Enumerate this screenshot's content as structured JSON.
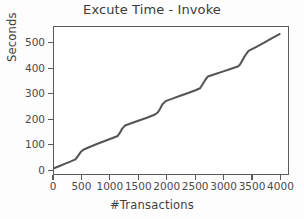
{
  "chart_data": {
    "type": "line",
    "title": "Excute Time - Invoke",
    "xlabel": "#Transactions",
    "ylabel": "Seconds",
    "xlim": [
      0,
      4150
    ],
    "ylim": [
      -18,
      565
    ],
    "grid": false,
    "legend": null,
    "line_color": "#555555",
    "line_width": 2.1,
    "xticks": [
      0,
      500,
      1000,
      1500,
      2000,
      2500,
      3000,
      3500,
      4000
    ],
    "xtick_labels": [
      "0",
      "500",
      "1000",
      "1500",
      "2000",
      "2500",
      "3000",
      "3500",
      "4000"
    ],
    "yticks": [
      0,
      100,
      200,
      300,
      400,
      500
    ],
    "ytick_labels": [
      "0",
      "100",
      "200",
      "300",
      "400",
      "500"
    ],
    "series": [
      {
        "name": "Invoke",
        "x": [
          0,
          100,
          200,
          300,
          380,
          420,
          470,
          520,
          620,
          760,
          900,
          1040,
          1130,
          1170,
          1210,
          1260,
          1380,
          1520,
          1660,
          1790,
          1840,
          1880,
          1920,
          1980,
          2100,
          2240,
          2380,
          2520,
          2590,
          2630,
          2680,
          2730,
          2850,
          2990,
          3130,
          3260,
          3300,
          3340,
          3390,
          3450,
          3580,
          3720,
          3860,
          4000
        ],
        "y": [
          5,
          14,
          23,
          32,
          40,
          52,
          68,
          78,
          88,
          101,
          113,
          125,
          133,
          146,
          162,
          174,
          184,
          195,
          206,
          218,
          226,
          240,
          258,
          271,
          281,
          292,
          303,
          315,
          322,
          336,
          354,
          369,
          378,
          388,
          398,
          408,
          416,
          432,
          452,
          470,
          485,
          502,
          520,
          537
        ]
      }
    ]
  }
}
